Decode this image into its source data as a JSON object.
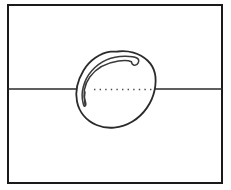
{
  "figure": {
    "title": "",
    "canvas": {
      "width": 231,
      "height": 190,
      "background": "#ffffff"
    },
    "style": {
      "frame_color": "#1a1a1a",
      "frame_stroke_width": 2,
      "axis_color": "#2b2b2b",
      "axis_stroke_width": 1.6,
      "outline_color": "#2b2b2b",
      "outline_stroke_width": 1.8,
      "inner_curve_color": "#3a3a3a",
      "inner_curve_stroke_width": 1.5,
      "dotted_color": "#4a4a4a",
      "dotted_stroke_width": 1.4,
      "dotted_dasharray": "1.4 4.2"
    },
    "frame": {
      "name": "outer-border-rectangle",
      "x": 8,
      "y": 5,
      "width": 214,
      "height": 178
    },
    "axis": {
      "name": "horizontal-axis-line",
      "y": 89,
      "x_start": 8,
      "x_end": 222
    },
    "shape": {
      "name": "egg-outline",
      "label": "",
      "center_x": 117,
      "center_y": 89,
      "path": "M 117.5 51.5 C 128.0 50.0 139.5 53.0 147.5 60.5 C 155.5 68.0 157.0 79.0 154.5 90.5 C 152.0 102.5 144.0 114.5 132.5 121.5 C 121.0 128.5 107.0 129.5 96.5 125.0 C 86.0 120.5 79.0 111.5 77.0 101.5 C 75.0 91.5 77.5 80.5 83.5 70.5 C 89.5 60.5 100.0 53.0 110.5 51.7 Z",
      "inner_curve_path": "M 83.0 102.5 C 80.5 93.0 83.5 80.0 92.0 70.5 C 100.5 61.0 113.0 56.0 125.5 56.2 C 131.5 56.3 135.0 57.0 136.8 58.0 C 138.6 59.0 139.2 60.8 138.2 62.8 C 137.3 64.6 135.7 65.6 134.0 65.2 C 132.5 64.8 131.6 63.4 131.4 61.7 C 129.0 60.6 124.0 60.2 118.5 61.0 C 107.0 62.6 96.0 68.5 89.8 77.0 C 84.0 85.0 82.8 94.5 85.2 101.0 C 86.0 103.2 86.2 105.0 85.2 106.0 C 84.2 107.0 83.5 105.0 83.0 102.5 Z",
      "inner_tail_path": "M 85.0 104.5 C 84.0 100.0 84.2 95.5 85.0 92.0"
    },
    "dotted_axis_segment": {
      "name": "egg-internal-dotted-axis",
      "y": 89.5,
      "x_start": 94,
      "x_end": 153
    }
  }
}
